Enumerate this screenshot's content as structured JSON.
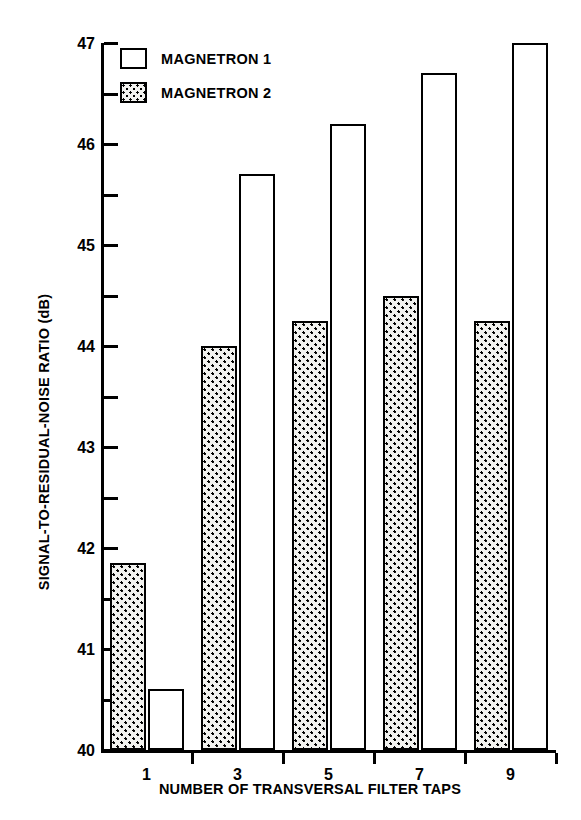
{
  "chart_data": {
    "type": "bar",
    "title": "",
    "xlabel": "NUMBER OF TRANSVERSAL FILTER TAPS",
    "ylabel": "SIGNAL-TO-RESIDUAL-NOISE RATIO (dB)",
    "categories": [
      "1",
      "3",
      "5",
      "7",
      "9"
    ],
    "ylim": [
      40,
      47
    ],
    "ytick_major": [
      40,
      41,
      42,
      43,
      44,
      45,
      46,
      47
    ],
    "ytick_minor": [
      40.5,
      41.5,
      42.5,
      43.5,
      44.5,
      45.5,
      46.5
    ],
    "ytick_labels": [
      "40",
      "41",
      "42",
      "43",
      "44",
      "45",
      "46",
      "47"
    ],
    "xtick_labels": [
      "1",
      "3",
      "5",
      "7",
      "9"
    ],
    "grid": false,
    "legend_position": "top-left-inside",
    "series": [
      {
        "name": "MAGNETRON 2",
        "fill": "dotted",
        "order_in_group": 1,
        "values": [
          41.85,
          44.0,
          44.25,
          44.5,
          44.25
        ]
      },
      {
        "name": "MAGNETRON 1",
        "fill": "white",
        "order_in_group": 2,
        "values": [
          40.6,
          45.7,
          46.2,
          46.7,
          47.0
        ]
      }
    ]
  },
  "legend": {
    "items": [
      {
        "label": "MAGNETRON 1",
        "swatch": "white-box-icon"
      },
      {
        "label": "MAGNETRON 2",
        "swatch": "dotted-box-icon"
      }
    ]
  }
}
